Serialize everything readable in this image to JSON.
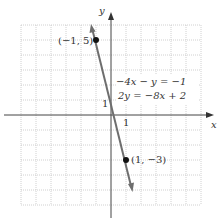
{
  "axes": {
    "x_label": "x",
    "y_label": "y",
    "x_tick_label": "1",
    "y_tick_label": "1"
  },
  "equations": {
    "line1": "−4x − y = −1",
    "line2": "2y = −8x + 2"
  },
  "points": [
    {
      "label": "(−1, 5)",
      "x": -1,
      "y": 5
    },
    {
      "label": "(1, −3)",
      "x": 1,
      "y": -3
    }
  ],
  "grid": {
    "xmin": -6,
    "xmax": 6,
    "ymin": -6,
    "ymax": 6,
    "step": 1
  },
  "colors": {
    "line": "#666666",
    "grid": "#bbbbbb",
    "axis": "#555555",
    "point": "#111111"
  }
}
